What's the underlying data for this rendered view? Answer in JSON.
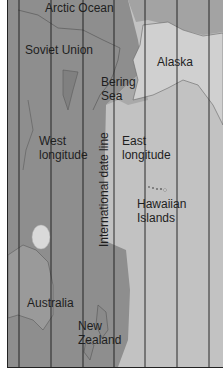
{
  "map": {
    "labels": {
      "arctic_ocean": "Arctic Ocean",
      "soviet_union": "Soviet Union",
      "alaska": "Alaska",
      "bering_sea_1": "Bering",
      "bering_sea_2": "Sea",
      "west_longitude_1": "West",
      "west_longitude_2": "longitude",
      "east_longitude_1": "East",
      "east_longitude_2": "longitude",
      "date_line": "International date line",
      "hawaiian_1": "Hawaiian",
      "hawaiian_2": "Islands",
      "australia": "Australia",
      "new_zealand_1": "New",
      "new_zealand_2": "Zealand"
    },
    "colors": {
      "west_side": "#8f8f8f",
      "east_side": "#c4c4c4",
      "land_alaska": "#d4d4d4",
      "lines": "#1a1a1a"
    },
    "meridian_count": 7
  }
}
